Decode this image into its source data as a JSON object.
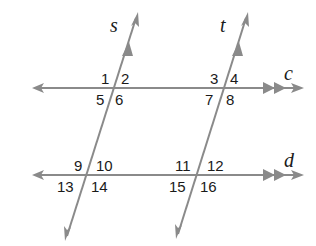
{
  "diagram": {
    "type": "parallel lines cut by transversals",
    "colors": {
      "line": "#8a8a8a",
      "text": "#1a1a1a",
      "background": "#ffffff"
    },
    "lines": {
      "c": {
        "label": "c",
        "kind": "parallel",
        "marks": "double arrowhead"
      },
      "d": {
        "label": "d",
        "kind": "parallel",
        "marks": "double arrowhead"
      },
      "s": {
        "label": "s",
        "kind": "transversal",
        "marks": "single arrowhead"
      },
      "t": {
        "label": "t",
        "kind": "transversal",
        "marks": "single arrowhead"
      }
    },
    "angles": {
      "a1": "1",
      "a2": "2",
      "a3": "3",
      "a4": "4",
      "a5": "5",
      "a6": "6",
      "a7": "7",
      "a8": "8",
      "a9": "9",
      "a10": "10",
      "a11": "11",
      "a12": "12",
      "a13": "13",
      "a14": "14",
      "a15": "15",
      "a16": "16"
    }
  }
}
